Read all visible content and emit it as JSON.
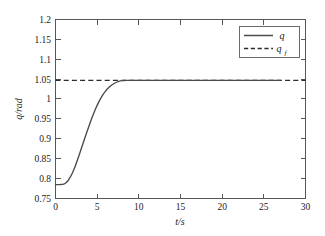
{
  "chart_data": {
    "type": "line",
    "title": "",
    "xlabel": "t/s",
    "ylabel": "q/rad",
    "xlim": [
      0,
      30
    ],
    "ylim": [
      0.75,
      1.2
    ],
    "xticks": [
      0,
      5,
      10,
      15,
      20,
      25,
      30
    ],
    "xtick_labels": [
      "0",
      "5",
      "10",
      "15",
      "20",
      "25",
      "30"
    ],
    "yticks": [
      0.75,
      0.8,
      0.85,
      0.9,
      0.95,
      1,
      1.05,
      1.1,
      1.15,
      1.2
    ],
    "ytick_labels": [
      "0.75",
      "0.8",
      "0.85",
      "0.9",
      "0.95",
      "1",
      "1.05",
      "1.1",
      "1.15",
      "1.2"
    ],
    "grid": false,
    "legend_position": "upper right",
    "series": [
      {
        "name": "q",
        "legend_label": "q",
        "style": "solid",
        "color": "#4a4a4a",
        "x": [
          0,
          0.5,
          1.0,
          1.3,
          1.6,
          2.0,
          2.4,
          2.8,
          3.2,
          3.6,
          4.0,
          4.4,
          4.8,
          5.2,
          5.6,
          6.0,
          6.4,
          6.8,
          7.2,
          7.6,
          8.0,
          8.4,
          8.8,
          9.2,
          9.6,
          10.0,
          11.0,
          13.0,
          15.0,
          18.0,
          21.0,
          24.0,
          27.0
        ],
        "y": [
          0.785,
          0.785,
          0.786,
          0.79,
          0.798,
          0.813,
          0.833,
          0.857,
          0.882,
          0.907,
          0.931,
          0.954,
          0.975,
          0.993,
          1.008,
          1.02,
          1.029,
          1.036,
          1.041,
          1.0445,
          1.0463,
          1.0468,
          1.047,
          1.0471,
          1.0471,
          1.0471,
          1.0471,
          1.0471,
          1.0471,
          1.0471,
          1.0471,
          1.0471,
          1.0471
        ]
      },
      {
        "name": "qf",
        "legend_label": "q_f",
        "style": "dashed",
        "color": "#2b2b2b",
        "x": [
          0,
          30
        ],
        "y": [
          1.0471,
          1.0471
        ]
      }
    ],
    "legend_entries": [
      {
        "label": "q",
        "subscript": "",
        "style": "solid"
      },
      {
        "label": "q",
        "subscript": "f",
        "style": "dashed"
      }
    ]
  }
}
